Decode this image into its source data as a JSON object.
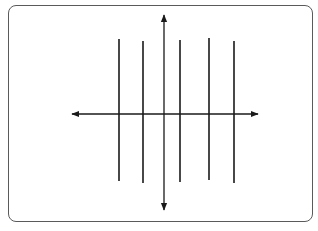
{
  "diagram": {
    "title": "",
    "colors": {
      "frame": "#5a5a5a",
      "lines": "#1a1a1a",
      "background": "#ffffff"
    },
    "axes": {
      "x_axis": {
        "y": 114,
        "x_start": 72,
        "x_end": 258,
        "arrows": "both"
      },
      "y_axis": {
        "x": 164,
        "y_start": 15,
        "y_end": 210,
        "arrows": "both"
      },
      "labels": []
    },
    "vertical_lines": [
      {
        "x": 119,
        "y_top": 39,
        "y_bottom": 181
      },
      {
        "x": 143,
        "y_top": 41,
        "y_bottom": 183
      },
      {
        "x": 180,
        "y_top": 40,
        "y_bottom": 182
      },
      {
        "x": 209,
        "y_top": 38,
        "y_bottom": 180
      },
      {
        "x": 234,
        "y_top": 41,
        "y_bottom": 183
      }
    ]
  }
}
